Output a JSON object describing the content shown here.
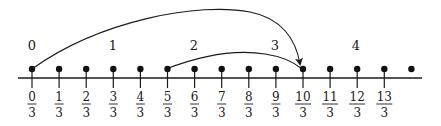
{
  "diagram": {
    "type": "number-line",
    "axis": {
      "x_start": 18,
      "x_end": 422,
      "y": 78,
      "color": "#1a1a1a"
    },
    "points": {
      "x0": 32,
      "spacing": 27.1,
      "count": 15,
      "dot_y": 69
    },
    "whole_labels": [
      {
        "text": "0",
        "x": 32
      },
      {
        "text": "1",
        "x": 113
      },
      {
        "text": "2",
        "x": 194
      },
      {
        "text": "3",
        "x": 275
      },
      {
        "text": "4",
        "x": 356
      }
    ],
    "fractions": [
      {
        "num": "0",
        "den": "3"
      },
      {
        "num": "1",
        "den": "3"
      },
      {
        "num": "2",
        "den": "3"
      },
      {
        "num": "3",
        "den": "3"
      },
      {
        "num": "4",
        "den": "3"
      },
      {
        "num": "5",
        "den": "3"
      },
      {
        "num": "6",
        "den": "3"
      },
      {
        "num": "7",
        "den": "3"
      },
      {
        "num": "8",
        "den": "3"
      },
      {
        "num": "9",
        "den": "3"
      },
      {
        "num": "10",
        "den": "3"
      },
      {
        "num": "11",
        "den": "3"
      },
      {
        "num": "12",
        "den": "3"
      },
      {
        "num": "13",
        "den": "3"
      }
    ],
    "arcs": [
      {
        "from": "0/3",
        "to": "10/3",
        "arrow": true,
        "label": "jump from 0 to 10/3"
      },
      {
        "from": "5/3",
        "to": "10/3",
        "arrow": false,
        "label": "jump from 5/3 to 10/3"
      }
    ]
  }
}
